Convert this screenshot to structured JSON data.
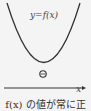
{
  "diagram": {
    "function_label": "y=f(x)",
    "x_axis_label": "x",
    "origin_symbol": "⊕",
    "caption": "f(x) の値が常に正",
    "curve_color": "#333333"
  }
}
